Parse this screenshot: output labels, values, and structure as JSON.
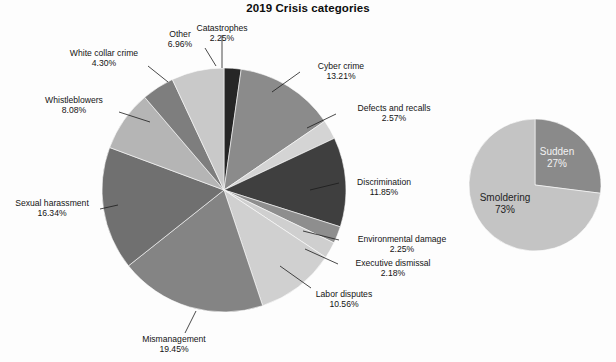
{
  "chart_data": [
    {
      "type": "pie",
      "title": "2019 Crisis categories",
      "name": "crisis-categories-pie",
      "labels_outside": true,
      "legend": "none",
      "label_suffix": "%",
      "categories": [
        "Catastrophes",
        "Cyber crime",
        "Defects and recalls",
        "Discrimination",
        "Environmental damage",
        "Executive dismissal",
        "Labor disputes",
        "Mismanagement",
        "Sexual harassment",
        "Whistleblowers",
        "White collar crime",
        "Other"
      ],
      "values": [
        2.25,
        13.21,
        2.57,
        11.85,
        2.25,
        2.18,
        10.56,
        19.45,
        16.34,
        8.08,
        4.3,
        6.96
      ],
      "value_labels": [
        "2.25%",
        "13.21%",
        "2.57%",
        "11.85%",
        "2.25%",
        "2.18%",
        "10.56%",
        "19.45%",
        "16.34%",
        "8.08%",
        "4.30%",
        "6.96%"
      ],
      "colors": [
        "#262626",
        "#8b8b8b",
        "#d4d4d4",
        "#3f3f3f",
        "#8e8e8e",
        "#cfcfcf",
        "#d0d0d0",
        "#848484",
        "#707070",
        "#b5b5b5",
        "#7e7e7e",
        "#c9c9c9"
      ],
      "total": 99.6
    },
    {
      "type": "pie",
      "title": "",
      "name": "crisis-onset-pie",
      "labels_outside": false,
      "legend": "none",
      "categories": [
        "Sudden",
        "Smoldering"
      ],
      "values": [
        27,
        73
      ],
      "value_labels": [
        "27%",
        "73%"
      ],
      "colors": [
        "#8a8a8a",
        "#c4c4c4"
      ],
      "total": 100
    }
  ],
  "title": "2019 Crisis categories",
  "main_pie": {
    "labels": [
      {
        "name": "catastrophes",
        "text": "Catastrophes",
        "value": "2.25%"
      },
      {
        "name": "cyber-crime",
        "text": "Cyber crime",
        "value": "13.21%"
      },
      {
        "name": "defects-and-recalls",
        "text": "Defects and recalls",
        "value": "2.57%"
      },
      {
        "name": "discrimination",
        "text": "Discrimination",
        "value": "11.85%"
      },
      {
        "name": "environmental-damage",
        "text": "Environmental damage",
        "value": "2.25%"
      },
      {
        "name": "executive-dismissal",
        "text": "Executive dismissal",
        "value": "2.18%"
      },
      {
        "name": "labor-disputes",
        "text": "Labor disputes",
        "value": "10.56%"
      },
      {
        "name": "mismanagement",
        "text": "Mismanagement",
        "value": "19.45%"
      },
      {
        "name": "sexual-harassment",
        "text": "Sexual harassment",
        "value": "16.34%"
      },
      {
        "name": "whistleblowers",
        "text": "Whistleblowers",
        "value": "8.08%"
      },
      {
        "name": "white-collar-crime",
        "text": "White collar crime",
        "value": "4.30%"
      },
      {
        "name": "other",
        "text": "Other",
        "value": "6.96%"
      }
    ]
  },
  "onset_pie": {
    "sudden": {
      "text": "Sudden",
      "value": "27%"
    },
    "smoldering": {
      "text": "Smoldering",
      "value": "73%"
    }
  }
}
